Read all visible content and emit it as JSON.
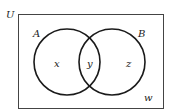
{
  "diagram": {
    "type": "venn",
    "universe_label": "U",
    "sets": [
      {
        "name": "A",
        "region_label": "x"
      },
      {
        "name": "B",
        "region_label": "z"
      }
    ],
    "intersection_label": "y",
    "outside_label": "w",
    "colors": {
      "stroke": "#1a1a1a",
      "background": "#ffffff"
    }
  }
}
